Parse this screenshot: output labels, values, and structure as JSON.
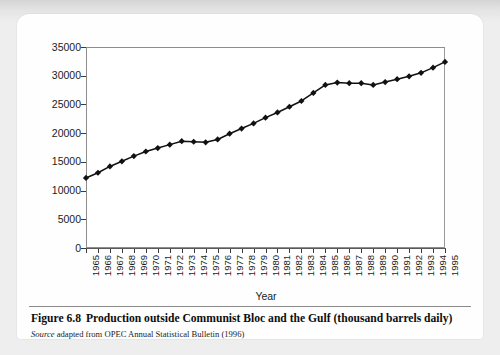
{
  "figure": {
    "caption_label": "Figure 6.8",
    "caption_text": "Production outside Communist Bloc and the Gulf (thousand barrels daily)",
    "source_word": "Source",
    "source_text": "adapted from OPEC Annual Statistical Bulletin (1996)"
  },
  "chart_data": {
    "type": "line",
    "title": "Production outside Communist Bloc and the Gulf (thousand barrels daily)",
    "xlabel": "Year",
    "ylabel": "",
    "xlim": [
      1965,
      1995
    ],
    "ylim": [
      0,
      35000
    ],
    "ytick_labels": [
      "0",
      "5000",
      "10000",
      "15000",
      "20000",
      "25000",
      "30000",
      "35000"
    ],
    "ytick_values": [
      0,
      5000,
      10000,
      15000,
      20000,
      25000,
      30000,
      35000
    ],
    "grid": false,
    "legend": "none",
    "marker": "diamond",
    "line_color": "#111111",
    "categories": [
      "1965",
      "1966",
      "1967",
      "1968",
      "1969",
      "1970",
      "1971",
      "1972",
      "1973",
      "1974",
      "1975",
      "1976",
      "1977",
      "1978",
      "1979",
      "1980",
      "1981",
      "1982",
      "1983",
      "1984",
      "1985",
      "1986",
      "1987",
      "1988",
      "1989",
      "1990",
      "1991",
      "1992",
      "1993",
      "1994",
      "1995"
    ],
    "values": [
      12200,
      13100,
      14200,
      15100,
      16000,
      16800,
      17400,
      18000,
      18600,
      18500,
      18400,
      18900,
      19900,
      20800,
      21700,
      22700,
      23600,
      24600,
      25600,
      27000,
      28400,
      28800,
      28700,
      28700,
      28400,
      28900,
      29400,
      29900,
      30500,
      31400,
      32400
    ]
  }
}
